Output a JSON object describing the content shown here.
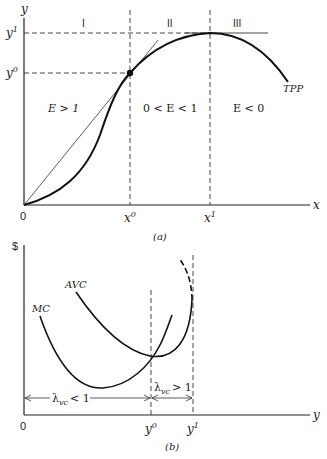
{
  "panel_a": {
    "caption": "(a)",
    "y_axis_label": "y",
    "x_axis_label": "x",
    "origin_label": "0",
    "y_ticks": [
      {
        "label": "y",
        "sup": "1"
      },
      {
        "label": "y",
        "sup": "0"
      }
    ],
    "x_ticks": [
      {
        "label": "x",
        "sup": "0"
      },
      {
        "label": "x",
        "sup": "1"
      }
    ],
    "regions": [
      {
        "roman": "I",
        "condition": "E > 1"
      },
      {
        "roman": "II",
        "condition": "0 < E < 1"
      },
      {
        "roman": "III",
        "condition": "E < 0"
      }
    ],
    "curve_label": "TPP"
  },
  "panel_b": {
    "caption": "(b)",
    "y_axis_label": "$",
    "x_axis_label": "y",
    "origin_label": "0",
    "x_ticks": [
      {
        "label": "y",
        "sup": "0"
      },
      {
        "label": "y",
        "sup": "1"
      }
    ],
    "curve_labels": {
      "mc": "MC",
      "avc": "AVC"
    },
    "ranges": [
      {
        "symbol": "λ",
        "sub": "vc",
        "relation": "< 1"
      },
      {
        "symbol": "λ",
        "sub": "vc",
        "relation": "> 1"
      }
    ]
  }
}
